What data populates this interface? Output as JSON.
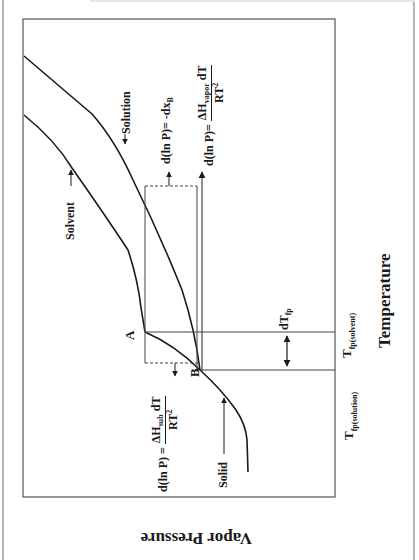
{
  "axes": {
    "x_title": "Temperature",
    "y_title": "Vapor Pressure"
  },
  "curves": {
    "solvent": "Solvent",
    "solution": "Solution",
    "solid": "Solid"
  },
  "points": {
    "a": "A",
    "b": "B"
  },
  "temperatures": {
    "t_solvent_main": "T",
    "t_solvent_sub": "fp(solvent)",
    "t_solution_main": "T",
    "t_solution_sub": "fp(solution)",
    "dt_main": "dT",
    "dt_sub": "fp"
  },
  "equations": {
    "eq1_left": "d(ln P)= -dx",
    "eq1_sub": "B",
    "eq2_left": "d(ln P)=",
    "eq2_num_main": "ΔH",
    "eq2_num_sub": "vapor",
    "eq2_num_tail": " dT",
    "eq2_den": "RT",
    "eq2_den_sup": "2",
    "eq3_left": "d(ln P) = ",
    "eq3_num_main": "ΔH",
    "eq3_num_sub": "sub",
    "eq3_num_tail": " dT",
    "eq3_den": "RT",
    "eq3_den_sup": "2"
  },
  "colors": {
    "line": "#1a1a1a",
    "frame": "#555555",
    "thin": "#444444"
  }
}
